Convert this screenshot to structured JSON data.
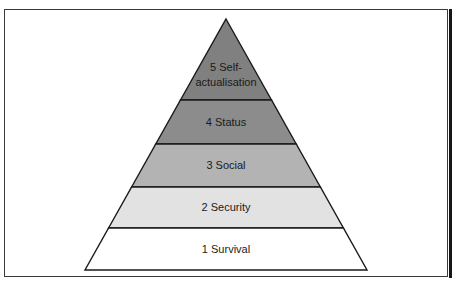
{
  "figure": {
    "frame_border_color": "#3a3a3a",
    "outline_color": "#1a1a1a",
    "background_color": "#ffffff"
  },
  "top_caption_fragment": "",
  "pyramid": {
    "apex_x": 226,
    "apex_y": 19,
    "base_left_x": 88,
    "base_right_x": 370,
    "base_y": 270,
    "tiers": [
      {
        "level": 5,
        "number": "5",
        "name": "Self-actualisation",
        "label_line_1": "5  Self-",
        "label_line_2": "actualisation",
        "fill": "#808080",
        "top_y": 19,
        "bottom_y": 100
      },
      {
        "level": 4,
        "number": "4",
        "name": "Status",
        "label_line_1": "4  Status",
        "label_line_2": "",
        "fill": "#8c8c8c",
        "top_y": 100,
        "bottom_y": 144
      },
      {
        "level": 3,
        "number": "3",
        "name": "Social",
        "label_line_1": "3  Social",
        "label_line_2": "",
        "fill": "#b3b3b3",
        "top_y": 144,
        "bottom_y": 187
      },
      {
        "level": 2,
        "number": "2",
        "name": "Security",
        "label_line_1": "2  Security",
        "label_line_2": "",
        "fill": "#e2e2e2",
        "top_y": 187,
        "bottom_y": 228
      },
      {
        "level": 1,
        "number": "1",
        "name": "Survival",
        "label_line_1": "1  Survival",
        "label_line_2": "",
        "fill": "#ffffff",
        "top_y": 228,
        "bottom_y": 270
      }
    ]
  }
}
